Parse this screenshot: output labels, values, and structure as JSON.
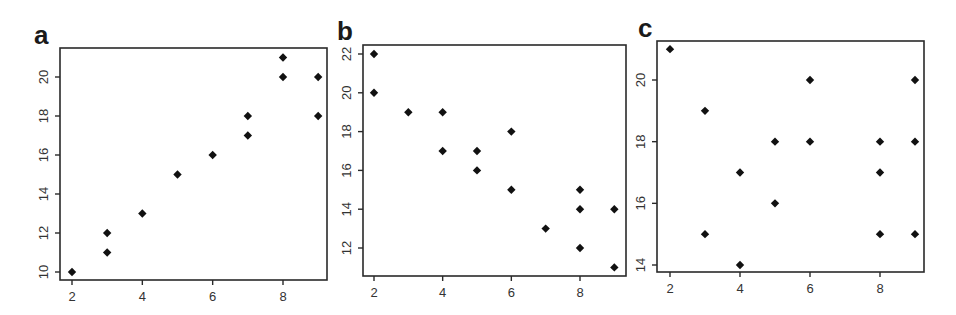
{
  "figure": {
    "panels": [
      {
        "letter": "a",
        "box": {
          "x": 60,
          "y": 48,
          "w": 267,
          "h": 232
        },
        "xmap": {
          "v0": 2,
          "p0": 72,
          "v1": 8,
          "p1": 283
        },
        "ymap": {
          "v0": 10,
          "p0": 272,
          "v1": 20,
          "p1": 77
        },
        "xticks": [
          2,
          4,
          6,
          8
        ],
        "yticks": [
          10,
          12,
          14,
          16,
          18,
          20
        ]
      },
      {
        "letter": "b",
        "box": {
          "x": 363,
          "y": 45,
          "w": 263,
          "h": 231
        },
        "xmap": {
          "v0": 2,
          "p0": 374,
          "v1": 8,
          "p1": 580
        },
        "ymap": {
          "v0": 12,
          "p0": 248,
          "v1": 22,
          "p1": 54
        },
        "xticks": [
          2,
          4,
          6,
          8
        ],
        "yticks": [
          12,
          14,
          16,
          18,
          20,
          22
        ]
      },
      {
        "letter": "c",
        "box": {
          "x": 657,
          "y": 41,
          "w": 267,
          "h": 231
        },
        "xmap": {
          "v0": 2,
          "p0": 670,
          "v1": 8,
          "p1": 880
        },
        "ymap": {
          "v0": 14,
          "p0": 265,
          "v1": 20,
          "p1": 80
        },
        "xticks": [
          2,
          4,
          6,
          8
        ],
        "yticks": [
          14,
          16,
          18,
          20
        ]
      }
    ]
  },
  "chart_data": [
    {
      "type": "scatter",
      "title": "a",
      "xlabel": "",
      "ylabel": "",
      "xlim": [
        1.8,
        9.3
      ],
      "ylim": [
        9.7,
        21.6
      ],
      "xticks": [
        2,
        4,
        6,
        8
      ],
      "yticks": [
        10,
        12,
        14,
        16,
        18,
        20
      ],
      "grid": false,
      "x": [
        2,
        3,
        3,
        4,
        5,
        6,
        7,
        7,
        8,
        8,
        9,
        9
      ],
      "y": [
        10,
        11,
        12,
        13,
        15,
        16,
        17,
        18,
        20,
        21,
        18,
        20
      ]
    },
    {
      "type": "scatter",
      "title": "b",
      "xlabel": "",
      "ylabel": "",
      "xlim": [
        1.7,
        9.3
      ],
      "ylim": [
        10.6,
        22.4
      ],
      "xticks": [
        2,
        4,
        6,
        8
      ],
      "yticks": [
        12,
        14,
        16,
        18,
        20,
        22
      ],
      "grid": false,
      "x": [
        2,
        2,
        3,
        4,
        4,
        5,
        5,
        6,
        6,
        7,
        8,
        8,
        8,
        9,
        9
      ],
      "y": [
        22,
        20,
        19,
        19,
        17,
        17,
        16,
        18,
        15,
        13,
        15,
        14,
        12,
        14,
        11
      ]
    },
    {
      "type": "scatter",
      "title": "c",
      "xlabel": "",
      "ylabel": "",
      "xlim": [
        1.6,
        9.3
      ],
      "ylim": [
        13.8,
        21.3
      ],
      "xticks": [
        2,
        4,
        6,
        8
      ],
      "yticks": [
        14,
        16,
        18,
        20
      ],
      "grid": false,
      "x": [
        2,
        3,
        3,
        4,
        4,
        5,
        5,
        6,
        6,
        8,
        8,
        8,
        9,
        9,
        9
      ],
      "y": [
        21,
        19,
        15,
        17,
        14,
        18,
        16,
        20,
        18,
        18,
        17,
        15,
        20,
        18,
        15
      ]
    }
  ]
}
